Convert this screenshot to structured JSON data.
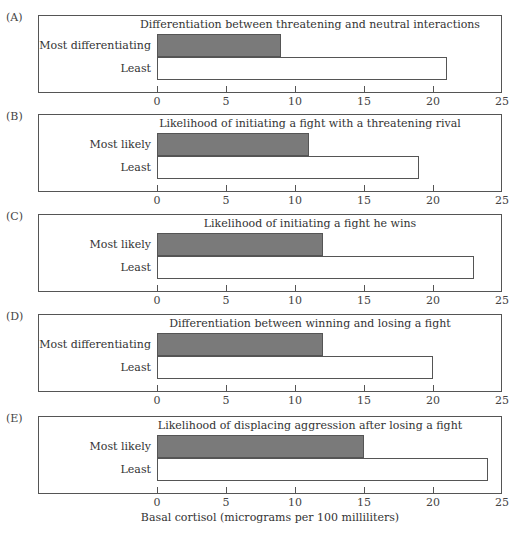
{
  "chart_data": [
    {
      "type": "bar",
      "orientation": "horizontal",
      "panel": "(A)",
      "title": "Differentiation between threatening and neutral interactions",
      "categories": [
        "Most differentiating",
        "Least"
      ],
      "values": [
        9,
        21
      ],
      "colors": [
        "#7a7a7a",
        "#ffffff"
      ],
      "xlim": [
        0,
        25
      ],
      "xticks": [
        0,
        5,
        10,
        15,
        20,
        25
      ]
    },
    {
      "type": "bar",
      "orientation": "horizontal",
      "panel": "(B)",
      "title": "Likelihood of initiating a fight with a threatening rival",
      "categories": [
        "Most likely",
        "Least"
      ],
      "values": [
        11,
        19
      ],
      "colors": [
        "#7a7a7a",
        "#ffffff"
      ],
      "xlim": [
        0,
        25
      ],
      "xticks": [
        0,
        5,
        10,
        15,
        20,
        25
      ]
    },
    {
      "type": "bar",
      "orientation": "horizontal",
      "panel": "(C)",
      "title": "Likelihood of initiating a fight he wins",
      "categories": [
        "Most likely",
        "Least"
      ],
      "values": [
        12,
        23
      ],
      "colors": [
        "#7a7a7a",
        "#ffffff"
      ],
      "xlim": [
        0,
        25
      ],
      "xticks": [
        0,
        5,
        10,
        15,
        20,
        25
      ]
    },
    {
      "type": "bar",
      "orientation": "horizontal",
      "panel": "(D)",
      "title": "Differentiation between winning and losing a fight",
      "categories": [
        "Most differentiating",
        "Least"
      ],
      "values": [
        12,
        20
      ],
      "colors": [
        "#7a7a7a",
        "#ffffff"
      ],
      "xlim": [
        0,
        25
      ],
      "xticks": [
        0,
        5,
        10,
        15,
        20,
        25
      ]
    },
    {
      "type": "bar",
      "orientation": "horizontal",
      "panel": "(E)",
      "title": "Likelihood of displacing aggression after losing a fight",
      "categories": [
        "Most likely",
        "Least"
      ],
      "values": [
        15,
        24
      ],
      "colors": [
        "#7a7a7a",
        "#ffffff"
      ],
      "xlim": [
        0,
        25
      ],
      "xticks": [
        0,
        5,
        10,
        15,
        20,
        25
      ],
      "xlabel": "Basal cortisol (micrograms per 100 milliliters)"
    }
  ],
  "xlabel": "Basal cortisol (micrograms per 100 milliliters)",
  "layout": {
    "panel_tops": [
      15,
      114,
      214,
      314,
      416
    ],
    "zero_x": 157,
    "px_per_unit": 13.8
  }
}
